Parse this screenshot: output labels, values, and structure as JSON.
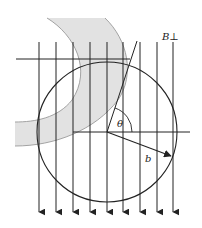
{
  "diagram": {
    "labels": {
      "field": "B⊥",
      "angle": "θ",
      "radius": "b"
    },
    "colors": {
      "stroke": "#222222",
      "band_fill": "#e2e2e2",
      "band_edge": "#9a9a9a"
    },
    "field_lines": {
      "count": 9,
      "x_positions": [
        39,
        56,
        73,
        90,
        107,
        123,
        140,
        157,
        173
      ],
      "direction": "down"
    },
    "circle": {
      "cx": 107,
      "cy": 132,
      "r": 70
    }
  }
}
